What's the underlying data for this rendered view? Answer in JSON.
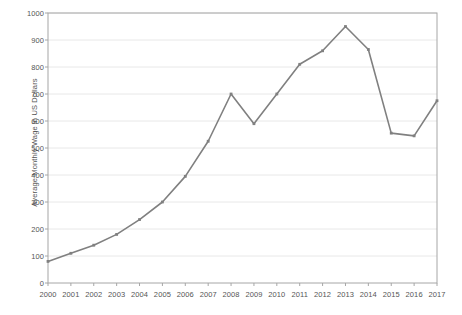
{
  "chart_data": {
    "type": "line",
    "title": "",
    "xlabel": "",
    "ylabel": "Average Monthly Wage in US Dollars",
    "categories": [
      "2000",
      "2001",
      "2002",
      "2003",
      "2004",
      "2005",
      "2006",
      "2007",
      "2008",
      "2009",
      "2010",
      "2011",
      "2012",
      "2013",
      "2014",
      "2015",
      "2016",
      "2017"
    ],
    "values": [
      80,
      110,
      140,
      180,
      235,
      300,
      395,
      525,
      700,
      590,
      700,
      810,
      860,
      950,
      865,
      555,
      545,
      675
    ],
    "series": [
      {
        "name": "Average Monthly Wage",
        "values": [
          80,
          110,
          140,
          180,
          235,
          300,
          395,
          525,
          700,
          590,
          700,
          810,
          860,
          950,
          865,
          555,
          545,
          675
        ]
      }
    ],
    "ylim": [
      0,
      1000
    ],
    "ytick_labels": [
      "0",
      "100",
      "200",
      "300",
      "400",
      "500",
      "600",
      "700",
      "800",
      "900",
      "1000"
    ],
    "ytick_values": [
      0,
      100,
      200,
      300,
      400,
      500,
      600,
      700,
      800,
      900,
      1000
    ],
    "xtick_labels": [
      "2000",
      "2001",
      "2002",
      "2003",
      "2004",
      "2005",
      "2006",
      "2007",
      "2008",
      "2009",
      "2010",
      "2011",
      "2012",
      "2013",
      "2014",
      "2015",
      "2016",
      "2017"
    ],
    "grid": true,
    "grid_axis": "y",
    "legend": false,
    "legend_position": "none",
    "markers": true,
    "line_color": "#808080",
    "grid_color": "#e8e8e8",
    "axis_color": "#a6a6a6",
    "tick_text_color": "#555555",
    "background_color": "#ffffff",
    "plot_background_color": "#ffffff"
  },
  "plot_geometry": {
    "left": 48,
    "top": 13,
    "right": 437,
    "bottom": 283
  }
}
